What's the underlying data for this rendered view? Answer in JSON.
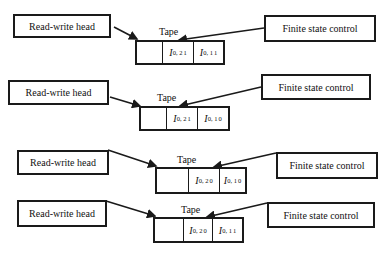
{
  "labels": {
    "head": "Read-write head",
    "control": "Finite state control",
    "tape": "Tape"
  },
  "rows": [
    {
      "head_label": "Read-write head",
      "control_label": "Finite state control",
      "tape_label": "Tape",
      "cells": [
        {
          "symbol": "",
          "sub": "",
          "sup": ""
        },
        {
          "symbol": "I",
          "sub": "0, 2",
          "sup": "1"
        },
        {
          "symbol": "I",
          "sub": "0, 1",
          "sup": "1"
        }
      ]
    },
    {
      "head_label": "Read-write head",
      "control_label": "Finite state control",
      "tape_label": "Tape",
      "cells": [
        {
          "symbol": "",
          "sub": "",
          "sup": ""
        },
        {
          "symbol": "I",
          "sub": "0, 2",
          "sup": "1"
        },
        {
          "symbol": "I",
          "sub": "0, 1",
          "sup": "0"
        }
      ]
    },
    {
      "head_label": "Read-write head",
      "control_label": "Finite state control",
      "tape_label": "Tape",
      "cells": [
        {
          "symbol": "",
          "sub": "",
          "sup": ""
        },
        {
          "symbol": "I",
          "sub": "0, 2",
          "sup": "0"
        },
        {
          "symbol": "I",
          "sub": "0, 1",
          "sup": "0"
        }
      ]
    },
    {
      "head_label": "Read-write head",
      "control_label": "Finite state control",
      "tape_label": "Tape",
      "cells": [
        {
          "symbol": "",
          "sub": "",
          "sup": ""
        },
        {
          "symbol": "I",
          "sub": "0, 2",
          "sup": "0"
        },
        {
          "symbol": "I",
          "sub": "0, 1",
          "sup": "1"
        }
      ]
    }
  ]
}
